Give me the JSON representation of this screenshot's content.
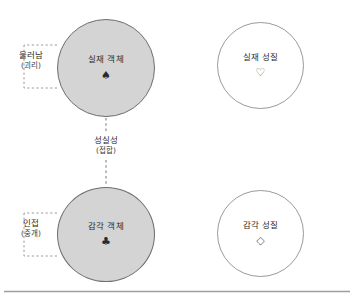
{
  "diagram": {
    "title": "",
    "colors": {
      "filled_node_fill": "#d4d4d4",
      "filled_node_stroke": "#6e6e6e",
      "hollow_node_stroke": "#9a9a9a",
      "dashed_line": "#8c8c8c",
      "baseline_rule": "#9e9e9e",
      "text": "#2b2b2b"
    },
    "nodes": [
      {
        "id": "real-object",
        "label": "실재 객체",
        "symbol": "♠",
        "symbol_name": "spade-symbol",
        "style": "filled"
      },
      {
        "id": "real-quality",
        "label": "실재 성질",
        "symbol": "♡",
        "symbol_name": "heart-outline-symbol",
        "style": "hollow"
      },
      {
        "id": "sense-object",
        "label": "감각 객체",
        "symbol": "♣",
        "symbol_name": "club-symbol",
        "style": "filled"
      },
      {
        "id": "sense-quality",
        "label": "감각 성질",
        "symbol": "◇",
        "symbol_name": "diamond-outline-symbol",
        "style": "hollow"
      }
    ],
    "edges": [
      {
        "id": "sincerity",
        "label": "성실성",
        "sublabel": "(접합)",
        "style": "dashed-vertical"
      }
    ],
    "brackets": [
      {
        "id": "disjunction",
        "label": "물러남",
        "sublabel": "(괴리)",
        "style": "dashed-bracket"
      },
      {
        "id": "contiguity",
        "label": "인접",
        "sublabel": "(중개)",
        "style": "dashed-bracket"
      }
    ]
  }
}
